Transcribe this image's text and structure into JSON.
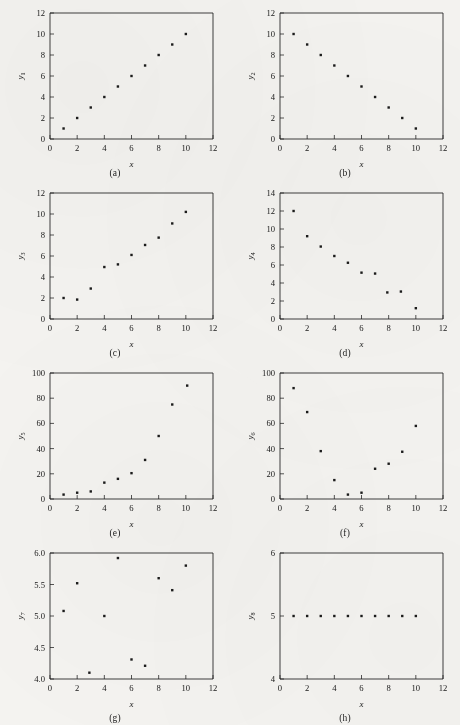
{
  "figure": {
    "background_color": "#f4f3f0",
    "ink_color": "#1b1b1b",
    "marker": "small-filled-square",
    "panel_count": 8
  },
  "chart_data": [
    {
      "type": "scatter",
      "panel": "(a)",
      "title": "",
      "xlabel": "x",
      "ylabel": "y1",
      "ylabel_base": "y",
      "ylabel_sub": "1",
      "xlim": [
        0,
        12
      ],
      "ylim": [
        0,
        12
      ],
      "xticks": [
        0,
        2,
        4,
        6,
        8,
        10,
        12
      ],
      "yticks": [
        0,
        2,
        4,
        6,
        8,
        10,
        12
      ],
      "grid": false,
      "legend": "none",
      "x": [
        1,
        2,
        3,
        4,
        5,
        6,
        7,
        8,
        9,
        10
      ],
      "values": [
        1,
        2,
        3,
        4,
        5,
        6,
        7,
        8,
        9,
        10
      ]
    },
    {
      "type": "scatter",
      "panel": "(b)",
      "title": "",
      "xlabel": "x",
      "ylabel": "y2",
      "ylabel_base": "y",
      "ylabel_sub": "2",
      "xlim": [
        0,
        12
      ],
      "ylim": [
        0,
        12
      ],
      "xticks": [
        0,
        2,
        4,
        6,
        8,
        10,
        12
      ],
      "yticks": [
        0,
        2,
        4,
        6,
        8,
        10,
        12
      ],
      "grid": false,
      "legend": "none",
      "x": [
        1,
        2,
        3,
        4,
        5,
        6,
        7,
        8,
        9,
        10
      ],
      "values": [
        10,
        9,
        8,
        7,
        6,
        5,
        4,
        3,
        2,
        1
      ]
    },
    {
      "type": "scatter",
      "panel": "(c)",
      "title": "",
      "xlabel": "x",
      "ylabel": "y3",
      "ylabel_base": "y",
      "ylabel_sub": "3",
      "xlim": [
        0,
        12
      ],
      "ylim": [
        0,
        12
      ],
      "xticks": [
        0,
        2,
        4,
        6,
        8,
        10,
        12
      ],
      "yticks": [
        0,
        2,
        4,
        6,
        8,
        10,
        12
      ],
      "grid": false,
      "legend": "none",
      "x": [
        1,
        2,
        3,
        4,
        5,
        6,
        7,
        8,
        9,
        10
      ],
      "values": [
        2.0,
        1.85,
        2.9,
        4.95,
        5.2,
        6.1,
        7.05,
        7.75,
        9.1,
        10.2
      ]
    },
    {
      "type": "scatter",
      "panel": "(d)",
      "title": "",
      "xlabel": "x",
      "ylabel": "y4",
      "ylabel_base": "y",
      "ylabel_sub": "4",
      "xlim": [
        0,
        12
      ],
      "ylim": [
        0,
        14
      ],
      "xticks": [
        0,
        2,
        4,
        6,
        8,
        10,
        12
      ],
      "yticks": [
        0,
        2,
        4,
        6,
        8,
        10,
        12,
        14
      ],
      "grid": false,
      "legend": "none",
      "x": [
        1,
        2,
        3,
        4,
        5,
        6,
        7,
        7.9,
        8.9,
        10
      ],
      "values": [
        12.0,
        9.2,
        8.05,
        7.0,
        6.25,
        5.15,
        5.05,
        2.95,
        3.05,
        1.2
      ]
    },
    {
      "type": "scatter",
      "panel": "(e)",
      "title": "",
      "xlabel": "x",
      "ylabel": "y5",
      "ylabel_base": "y",
      "ylabel_sub": "5",
      "xlim": [
        0,
        12
      ],
      "ylim": [
        0,
        100
      ],
      "xticks": [
        0,
        2,
        4,
        6,
        8,
        10,
        12
      ],
      "yticks": [
        0,
        20,
        40,
        60,
        80,
        100
      ],
      "grid": false,
      "legend": "none",
      "x": [
        1,
        2,
        3,
        4,
        5,
        6,
        7,
        8,
        9,
        10.1
      ],
      "values": [
        3.5,
        5.0,
        6.0,
        13.0,
        16.0,
        20.5,
        31.0,
        50.0,
        75.0,
        90.0
      ]
    },
    {
      "type": "scatter",
      "panel": "(f)",
      "title": "",
      "xlabel": "x",
      "ylabel": "y6",
      "ylabel_base": "y",
      "ylabel_sub": "6",
      "xlim": [
        0,
        12
      ],
      "ylim": [
        0,
        100
      ],
      "xticks": [
        0,
        2,
        4,
        6,
        8,
        10,
        12
      ],
      "yticks": [
        0,
        20,
        40,
        60,
        80,
        100
      ],
      "grid": false,
      "legend": "none",
      "x": [
        1,
        2,
        3,
        4,
        5,
        6,
        7,
        8,
        9,
        10
      ],
      "values": [
        88.0,
        69.0,
        38.0,
        15.0,
        3.5,
        5.0,
        24.0,
        28.0,
        37.5,
        58.0
      ]
    },
    {
      "type": "scatter",
      "panel": "(g)",
      "title": "",
      "xlabel": "x",
      "ylabel": "y7",
      "ylabel_base": "y",
      "ylabel_sub": "7",
      "xlim": [
        0,
        12
      ],
      "ylim": [
        4.0,
        6.0
      ],
      "xticks": [
        0,
        2,
        4,
        6,
        8,
        10,
        12
      ],
      "yticks": [
        "4.0",
        "4.5",
        "5.0",
        "5.5",
        "6.0"
      ],
      "ytick_values": [
        4.0,
        4.5,
        5.0,
        5.5,
        6.0
      ],
      "grid": false,
      "legend": "none",
      "x": [
        1,
        2,
        2.9,
        4,
        5,
        6,
        7,
        8,
        9,
        10
      ],
      "values": [
        5.08,
        5.52,
        4.1,
        5.0,
        5.92,
        4.31,
        4.21,
        5.6,
        5.41,
        5.8
      ]
    },
    {
      "type": "scatter",
      "panel": "(h)",
      "title": "",
      "xlabel": "x",
      "ylabel": "y8",
      "ylabel_base": "y",
      "ylabel_sub": "8",
      "xlim": [
        0,
        12
      ],
      "ylim": [
        4,
        6
      ],
      "xticks": [
        0,
        2,
        4,
        6,
        8,
        10,
        12
      ],
      "yticks": [
        4,
        5,
        6
      ],
      "grid": false,
      "legend": "none",
      "x": [
        1,
        2,
        3,
        4,
        5,
        6,
        7,
        8,
        9,
        10
      ],
      "values": [
        5,
        5,
        5,
        5,
        5,
        5,
        5,
        5,
        5,
        5
      ]
    }
  ]
}
